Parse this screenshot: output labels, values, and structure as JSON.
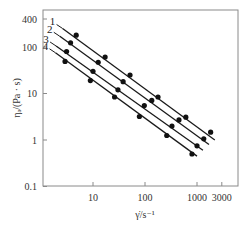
{
  "chart_data": {
    "type": "line",
    "title": "",
    "xlabel": "γ̇/s⁻¹",
    "ylabel": "ηₐ/(Pa · s)",
    "xscale": "log",
    "yscale": "log",
    "xlim": [
      1.1,
      5500
    ],
    "ylim": [
      0.1,
      700
    ],
    "xticks": [
      10,
      100,
      1000,
      3000
    ],
    "xtick_labels": [
      "10",
      "100",
      "1000",
      "3000"
    ],
    "yticks": [
      0.1,
      1,
      10,
      100,
      400
    ],
    "ytick_labels": [
      "0.1",
      "1",
      "10",
      "100",
      "400"
    ],
    "grid": false,
    "legend": "inline numeric labels at upper-left of each line",
    "series": [
      {
        "name": "1",
        "line": [
          [
            2.6,
            250
          ],
          [
            2200,
            1.0
          ]
        ],
        "x": [
          4.75,
          17.1,
          51.5,
          178,
          610,
          1830
        ],
        "y": [
          180,
          61,
          25,
          8.4,
          3.1,
          1.47
        ]
      },
      {
        "name": "2",
        "line": [
          [
            2.3,
            170
          ],
          [
            1700,
            0.8
          ]
        ],
        "x": [
          3.7,
          12.6,
          38,
          135,
          450,
          1350
        ],
        "y": [
          123,
          47,
          18,
          7.1,
          2.7,
          1.06
        ]
      },
      {
        "name": "3",
        "line": [
          [
            1.95,
            105
          ],
          [
            1300,
            0.6
          ]
        ],
        "x": [
          3.1,
          10,
          30.2,
          97,
          330,
          1000
        ],
        "y": [
          80,
          30,
          12,
          5.5,
          2.0,
          0.75
        ]
      },
      {
        "name": "4",
        "line": [
          [
            1.9,
            75
          ],
          [
            1000,
            0.45
          ]
        ],
        "x": [
          2.9,
          8.9,
          26,
          78,
          262,
          800
        ],
        "y": [
          49,
          19,
          8.4,
          3.2,
          1.25,
          0.5
        ]
      }
    ]
  },
  "colors": {
    "axis": "#8a8a8a",
    "line": "#1a1a1a",
    "marker": "#111111",
    "text": "#333333"
  }
}
